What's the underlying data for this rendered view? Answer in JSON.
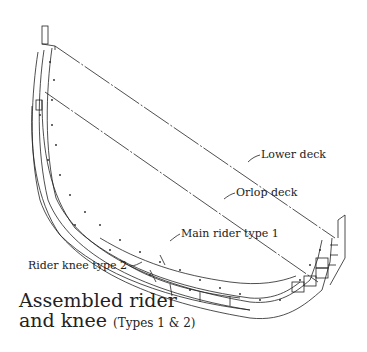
{
  "diagram": {
    "labels": {
      "lower_deck": "Lower deck",
      "orlop_deck": "Orlop deck",
      "main_rider": "Main rider type 1",
      "rider_knee": "Rider knee type 2"
    },
    "caption": {
      "line1": "Assembled rider",
      "line2_main": "and knee",
      "line2_sub": "(Types 1 & 2)"
    }
  }
}
